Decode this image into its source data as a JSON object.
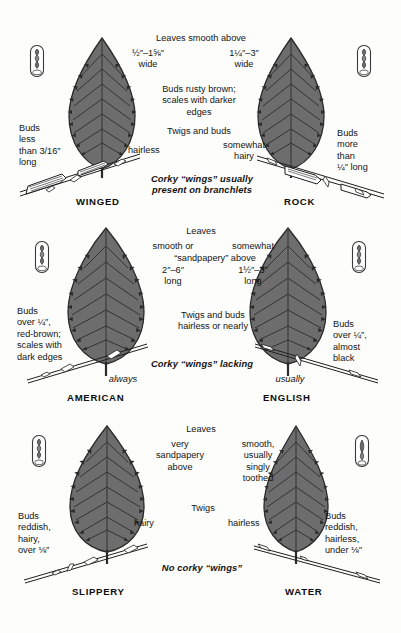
{
  "figure": {
    "leaf_fill": "#6d6d6d",
    "leaf_stroke": "#2b2b2b",
    "vein_color": "#3a3a3a",
    "line_color": "#1f1f1f",
    "background": "#fdfdfc"
  },
  "panels": [
    {
      "id": "winged",
      "species_label": "WINGED",
      "left_note": [
        "Buds",
        "less",
        "than 3/16″",
        "long"
      ],
      "size_note": [
        "½″–1⅝″",
        "wide"
      ],
      "side_note": [
        "hairless"
      ],
      "bud_icon": "bud-scales-icon"
    },
    {
      "id": "rock",
      "species_label": "ROCK",
      "left_note": [
        "Buds",
        "more",
        "than",
        "¼″ long"
      ],
      "size_note": [
        "1¼″–3″",
        "wide"
      ],
      "side_note": [
        "somewhat",
        "hairy"
      ],
      "bud_icon": "bud-scales-icon"
    },
    {
      "id": "american",
      "species_label": "AMERICAN",
      "left_note": [
        "Buds",
        "over ¼″,",
        "red-brown;",
        "scales with",
        "dark edges"
      ],
      "size_note": [
        "smooth or",
        "2″–6″",
        "long"
      ],
      "qualifier": "always",
      "bud_icon": "bud-scales-icon"
    },
    {
      "id": "english",
      "species_label": "ENGLISH",
      "left_note": [
        "Buds",
        "over ¼″,",
        "almost",
        "black"
      ],
      "size_note": [
        "somewhat",
        "1½″–3″",
        "long"
      ],
      "qualifier": "usually",
      "bud_icon": "bud-scales-icon"
    },
    {
      "id": "slippery",
      "species_label": "SLIPPERY",
      "left_note": [
        "Buds",
        "reddish,",
        "hairy,",
        "over ⅛″"
      ],
      "size_note": [
        "very",
        "sandpapery",
        "above"
      ],
      "side_note": [
        "hairy"
      ],
      "bud_icon": "bud-scales-icon"
    },
    {
      "id": "water",
      "species_label": "WATER",
      "left_note": [
        "Buds",
        "reddish,",
        "hairless,",
        "under ⅛″"
      ],
      "size_note": [
        "smooth,",
        "usually",
        "singly",
        "toothed"
      ],
      "side_note": [
        "hairless"
      ],
      "bud_icon": "bud-scales-icon"
    }
  ],
  "row1": {
    "heading": "Leaves smooth above",
    "left_width": [
      "½″–1⅝″",
      "wide"
    ],
    "right_width": [
      "1¼″–3″",
      "wide"
    ],
    "buds_note": [
      "Buds rusty brown;",
      "scales with darker",
      "edges"
    ],
    "twigs_note": [
      "Twigs and buds"
    ],
    "left_hair": "hairless",
    "right_hair": [
      "somewhat",
      "hairy"
    ],
    "left_buds": [
      "Buds",
      "less",
      "than 3/16″",
      "long"
    ],
    "right_buds": [
      "Buds",
      "more",
      "than",
      "¼″ long"
    ],
    "corky_note": [
      "Corky “wings” usually",
      "present on branchlets"
    ],
    "left_species": "WINGED",
    "right_species": "ROCK"
  },
  "row2": {
    "heading": "Leaves",
    "left_col": [
      "smooth or"
    ],
    "right_col": [
      "somewhat"
    ],
    "span_line": "“sandpapery” above",
    "left_size": [
      "2″–6″",
      "long"
    ],
    "right_size": [
      "1½″–3″",
      "long"
    ],
    "twigs_note": [
      "Twigs and buds",
      "hairless or nearly"
    ],
    "left_buds": [
      "Buds",
      "over ¼″,",
      "red-brown;",
      "scales with",
      "dark edges"
    ],
    "right_buds": [
      "Buds",
      "over ¼″,",
      "almost",
      "black"
    ],
    "corky_note": "Corky “wings” lacking",
    "left_qualifier": "always",
    "right_qualifier": "usually",
    "left_species": "AMERICAN",
    "right_species": "ENGLISH"
  },
  "row3": {
    "heading": "Leaves",
    "left_col": [
      "very",
      "sandpapery",
      "above"
    ],
    "right_col": [
      "smooth,",
      "usually",
      "singly",
      "toothed"
    ],
    "twigs_note": "Twigs",
    "left_hair": "hairy",
    "right_hair": "hairless",
    "left_buds": [
      "Buds",
      "reddish,",
      "hairy,",
      "over ⅛″"
    ],
    "right_buds": [
      "Buds",
      "reddish,",
      "hairless,",
      "under ⅛″"
    ],
    "corky_note": "No corky “wings”",
    "left_species": "SLIPPERY",
    "right_species": "WATER"
  }
}
